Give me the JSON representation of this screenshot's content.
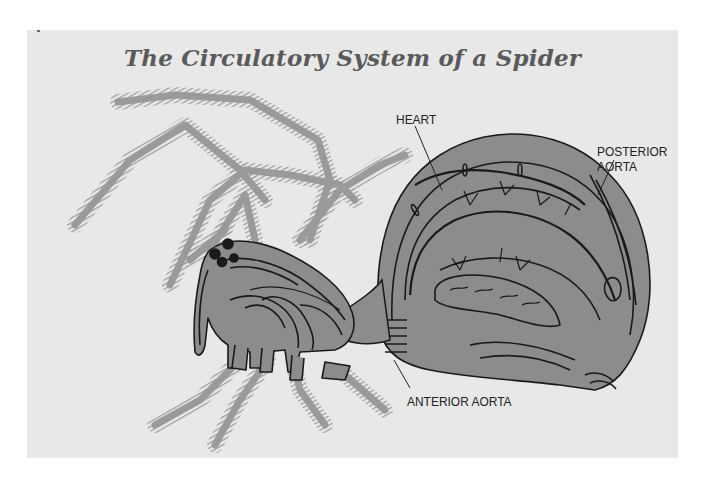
{
  "title": "The Circulatory System of a Spider",
  "labels": {
    "heart": "HEART",
    "posterior_aorta_line1": "POSTERIOR",
    "posterior_aorta_line2": "AORTA",
    "anterior_aorta": "ANTERIOR AORTA"
  },
  "colors": {
    "panel_background": "#e8e8e8",
    "title": "#5a5a5a",
    "body_fill": "#8c8c8c",
    "leg_fill": "#9a9a9a",
    "outline": "#1a1a1a"
  }
}
